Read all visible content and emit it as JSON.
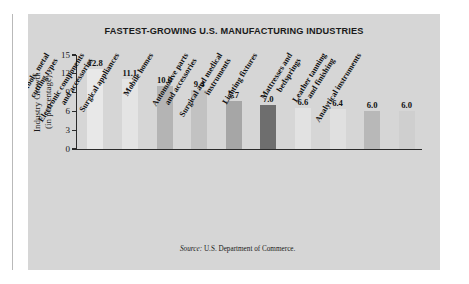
{
  "chart_data": {
    "type": "bar",
    "title": "FASTEST-GROWING U.S. MANUFACTURING INDUSTRIES",
    "xlabel": "",
    "ylabel": "Industry Growth\n(in percentage)",
    "ylabel_line1": "Industry Growth",
    "ylabel_line2": "(in percentage)",
    "ylim": [
      0,
      15
    ],
    "yticks": [
      "15",
      "12",
      "9",
      "6",
      "3",
      "0"
    ],
    "ytick_values": [
      15,
      12,
      9,
      6,
      3,
      0
    ],
    "grid": false,
    "legend": "none",
    "categories": [
      "Machine tools, metal\ncutting types",
      "Electronic components\nand accessories",
      "Surgical appliances",
      "Mobile homes",
      "Automotive parts\nand accessories",
      "Surgical and medical\ninstruments",
      "Lighting fixtures",
      "Mattresses and\nbedsprings",
      "Leather tanning\nand finishing",
      "Analytical instruments"
    ],
    "values": [
      12.8,
      11.1,
      10.0,
      9.4,
      7.7,
      7.0,
      6.6,
      6.4,
      6.0,
      6.0
    ],
    "value_labels": [
      "12.8",
      "11.1",
      "10.0",
      "9.4",
      "7.7",
      "7.0",
      "6.6",
      "6.4",
      "6.0",
      "6.0"
    ],
    "bar_colors": [
      "#e8e8e8",
      "#e4e4e4",
      "#b4b4b4",
      "#c2c2c2",
      "#a6a6a6",
      "#6e6e6e",
      "#e2e2e2",
      "#e0e0e0",
      "#b8b8b8",
      "#cfcfcf"
    ],
    "source": "U.S. Department of Commerce.",
    "source_prefix": "Source:"
  },
  "colors": {
    "panel_background": "#d6d6d6",
    "page_background": "#ffffff",
    "axis": "#2b2b2b",
    "text": "#111111",
    "highlight_bar": "#6e6e6e"
  }
}
